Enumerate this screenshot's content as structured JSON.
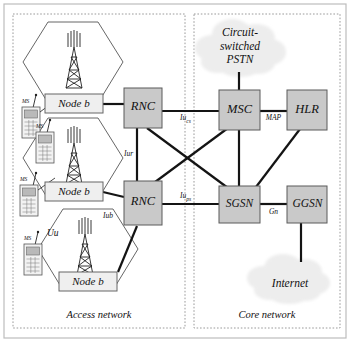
{
  "diagram": {
    "regions": [
      {
        "id": "access",
        "label": "Access network"
      },
      {
        "id": "core",
        "label": "Core network"
      }
    ],
    "clouds": [
      {
        "id": "pstn",
        "lines": [
          "Circuit-",
          "switched",
          "PSTN"
        ]
      },
      {
        "id": "internet",
        "lines": [
          "Internet"
        ]
      }
    ],
    "nodes": [
      {
        "id": "nodeb1",
        "label": "Node b",
        "type": "nodeb"
      },
      {
        "id": "nodeb2",
        "label": "Node b",
        "type": "nodeb"
      },
      {
        "id": "nodeb3",
        "label": "Node b",
        "type": "nodeb"
      },
      {
        "id": "rnc1",
        "label": "RNC",
        "type": "network-element"
      },
      {
        "id": "rnc2",
        "label": "RNC",
        "type": "network-element"
      },
      {
        "id": "msc",
        "label": "MSC",
        "type": "network-element"
      },
      {
        "id": "hlr",
        "label": "HLR",
        "type": "network-element"
      },
      {
        "id": "sgsn",
        "label": "SGSN",
        "type": "network-element"
      },
      {
        "id": "ggsn",
        "label": "GGSN",
        "type": "network-element"
      }
    ],
    "terminals": [
      {
        "id": "ms1",
        "label": "MS"
      },
      {
        "id": "ms2",
        "label": "MS"
      },
      {
        "id": "ms3",
        "label": "MS"
      },
      {
        "id": "ms4",
        "label": "MS"
      }
    ],
    "interfaces": [
      {
        "id": "uu",
        "label": "Uu",
        "sub": ""
      },
      {
        "id": "iub",
        "label": "Iub",
        "sub": ""
      },
      {
        "id": "iur",
        "label": "Iur",
        "sub": ""
      },
      {
        "id": "iucs",
        "label": "Iu",
        "sub": "cs"
      },
      {
        "id": "iups",
        "label": "Iu",
        "sub": "ps"
      },
      {
        "id": "map",
        "label": "MAP",
        "sub": ""
      },
      {
        "id": "gn",
        "label": "Gn",
        "sub": ""
      }
    ],
    "colors": {
      "box_fill": "#c8c8c8",
      "box_stroke": "#555555",
      "nodeb_fill": "#e8e8e8",
      "line": "#1a1a1a",
      "cell_stroke": "#4a4a4a",
      "cloud_fill": "#ececec",
      "region_border": "#9a9a9a",
      "background": "#ffffff"
    }
  }
}
